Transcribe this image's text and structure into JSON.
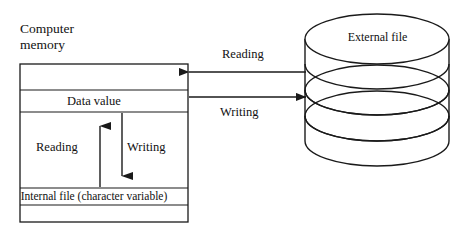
{
  "figure": {
    "title_implicit": "Reading and writing between computer memory and an external file",
    "stroke_color": "#1a1a1a",
    "background_color": "#ffffff"
  },
  "memory": {
    "title_line1": "Computer",
    "title_line2": "memory",
    "box": {
      "x": 20,
      "y": 64,
      "width": 168,
      "height": 158,
      "dividers_y": [
        90,
        112,
        188,
        205
      ]
    },
    "cells": [
      {
        "name": "empty-top",
        "label": ""
      },
      {
        "name": "data-value",
        "label": "Data value"
      },
      {
        "name": "transfer-area",
        "label": ""
      },
      {
        "name": "internal-file",
        "label": "Internal file (character variable)"
      },
      {
        "name": "empty-bottom",
        "label": ""
      }
    ],
    "internal_arrows": [
      {
        "name": "reading-up-arrow",
        "label": "Reading",
        "direction": "up",
        "x": 100
      },
      {
        "name": "writing-down-arrow",
        "label": "Writing",
        "direction": "down",
        "x": 122
      }
    ]
  },
  "transfer_arrows": [
    {
      "name": "reading-arrow",
      "label": "Reading",
      "direction": "left",
      "y": 72,
      "from": "external-file",
      "to": "computer-memory"
    },
    {
      "name": "writing-arrow",
      "label": "Writing",
      "direction": "right",
      "y": 97,
      "from": "computer-memory",
      "to": "external-file"
    }
  ],
  "external_file": {
    "label": "External file",
    "shape": "disk-cylinder-stack",
    "layers": 3,
    "cx": 377,
    "left_x": 305,
    "right_x": 449,
    "top_y": 14,
    "bottom_y": 166
  }
}
